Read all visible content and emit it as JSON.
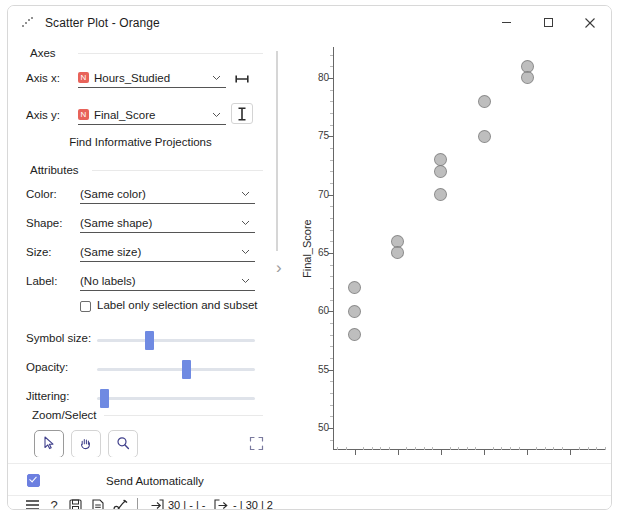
{
  "window": {
    "title": "Scatter Plot - Orange",
    "title_icon": "scatter-plot-icon",
    "minimize": "—",
    "maximize": "□",
    "close": "✕"
  },
  "controls": {
    "axes_section": "Axes",
    "axis_x_label": "Axis x:",
    "axis_x_value": "Hours_Studied",
    "axis_x_var_type": "N",
    "axis_y_label": "Axis y:",
    "axis_y_value": "Final_Score",
    "axis_y_var_type": "N",
    "find_projections": "Find Informative Projections",
    "attributes_section": "Attributes",
    "color_label": "Color:",
    "color_value": "(Same color)",
    "shape_label": "Shape:",
    "shape_value": "(Same shape)",
    "size_label": "Size:",
    "size_value": "(Same size)",
    "label_label": "Label:",
    "label_value": "(No labels)",
    "label_only_selection": "Label only selection and subset",
    "label_only_selection_checked": false,
    "symbol_size_label": "Symbol size:",
    "symbol_size_pct": 32,
    "opacity_label": "Opacity:",
    "opacity_pct": 57,
    "jittering_label": "Jittering:",
    "jittering_pct": 2,
    "zoom_select_section": "Zoom/Select",
    "tool_select": "arrow-select-icon",
    "tool_pan": "hand-pan-icon",
    "tool_zoom": "magnifier-zoom-icon",
    "tool_reset": "reset-zoom-icon",
    "send_automatically": "Send Automatically",
    "send_automatically_checked": true,
    "accent_color": "#6f8ae2",
    "var_icon_color": "#e8635a"
  },
  "statusbar": {
    "menu_icon": "hamburger-menu-icon",
    "help_icon": "help-question-icon",
    "save_icon": "save-floppy-icon",
    "report_icon": "report-document-icon",
    "brush_icon": "brush-icon",
    "input_icon": "input-arrow-icon",
    "input_text": "30 | - | -",
    "output_icon": "output-arrow-icon",
    "output_text": "- | 30 | 2"
  },
  "chart_data": {
    "type": "scatter",
    "title": "",
    "xlabel": "Hours_Studied",
    "ylabel": "Final_Score",
    "xlim": [
      4.5,
      10.8
    ],
    "ylim": [
      48.2,
      82.3
    ],
    "xticks": [
      5,
      6,
      7,
      8,
      9,
      10
    ],
    "yticks": [
      50,
      55,
      60,
      65,
      70,
      75,
      80
    ],
    "grid": false,
    "legend": null,
    "marker_color": "#969696",
    "points": [
      {
        "x": 5,
        "y": 62
      },
      {
        "x": 5,
        "y": 60
      },
      {
        "x": 5,
        "y": 58
      },
      {
        "x": 6,
        "y": 66
      },
      {
        "x": 6,
        "y": 65
      },
      {
        "x": 7,
        "y": 73
      },
      {
        "x": 7,
        "y": 72
      },
      {
        "x": 7,
        "y": 70
      },
      {
        "x": 8,
        "y": 78
      },
      {
        "x": 8,
        "y": 75
      },
      {
        "x": 9,
        "y": 81
      },
      {
        "x": 9,
        "y": 80
      }
    ]
  }
}
